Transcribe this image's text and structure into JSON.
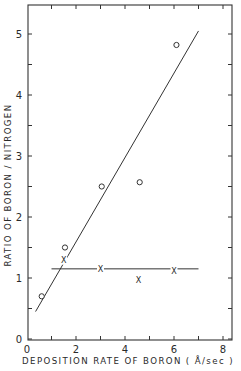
{
  "chart_data": {
    "type": "scatter",
    "title": "",
    "xlabel": "DEPOSITION RATE OF BORON ( Å/sec )",
    "ylabel": "RATIO OF BORON / NITROGEN",
    "xlim": [
      0,
      8.4
    ],
    "ylim": [
      0,
      5.5
    ],
    "x_ticks": [
      0,
      2,
      4,
      6,
      8
    ],
    "y_ticks": [
      0,
      1,
      2,
      3,
      4,
      5
    ],
    "x_minor_ticks": [
      1,
      3,
      5,
      7
    ],
    "y_minor_ticks": [
      0.5,
      1.5,
      2.5,
      3.5,
      4.5
    ],
    "grid": false,
    "legend": null,
    "series": [
      {
        "name": "circles",
        "marker": "o",
        "points": [
          {
            "x": 0.6,
            "y": 0.7
          },
          {
            "x": 1.55,
            "y": 1.5
          },
          {
            "x": 3.05,
            "y": 2.5
          },
          {
            "x": 4.6,
            "y": 2.57
          },
          {
            "x": 6.1,
            "y": 4.82
          }
        ]
      },
      {
        "name": "crosses",
        "marker": "x",
        "points": [
          {
            "x": 1.5,
            "y": 1.3
          },
          {
            "x": 3.0,
            "y": 1.15
          },
          {
            "x": 4.55,
            "y": 0.97
          },
          {
            "x": 6.0,
            "y": 1.13
          }
        ]
      }
    ],
    "lines": [
      {
        "name": "circle-fit",
        "x": [
          0.35,
          7.0
        ],
        "y": [
          0.45,
          5.05
        ]
      },
      {
        "name": "cross-fit",
        "x": [
          1.0,
          7.0
        ],
        "y": [
          1.15,
          1.15
        ]
      }
    ]
  },
  "labels": {
    "xlabel": "DEPOSITION RATE OF BORON ( Å/sec )",
    "ylabel": "RATIO OF BORON / NITROGEN",
    "x_origin": "0",
    "y_origin": "0"
  }
}
